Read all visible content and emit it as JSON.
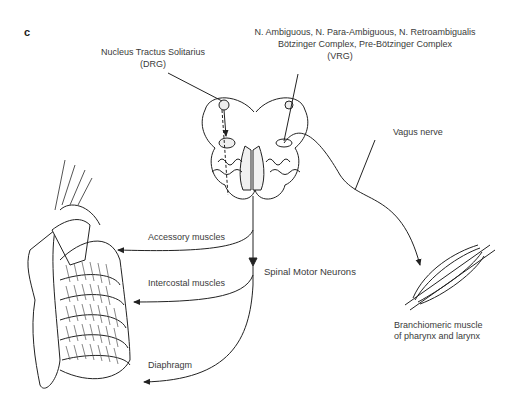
{
  "panel_label": "c",
  "labels": {
    "nts": "Nucleus Tractus Solitarius",
    "drg": "(DRG)",
    "vrg_line1": "N. Ambiguous, N. Para-Ambiguous, N. Retroambigualis",
    "vrg_line2": "Bötzinger Complex, Pre-Bötzinger Complex",
    "vrg": "(VRG)",
    "vagus": "Vagus nerve",
    "accessory": "Accessory muscles",
    "intercostal": "Intercostal muscles",
    "spinal": "Spinal Motor Neurons",
    "diaphragm": "Diaphragm",
    "branch_line1": "Branchiomeric muscle",
    "branch_line2": "of pharynx and larynx"
  },
  "colors": {
    "stroke": "#222222",
    "text": "#3a3a3a",
    "background": "#ffffff"
  }
}
